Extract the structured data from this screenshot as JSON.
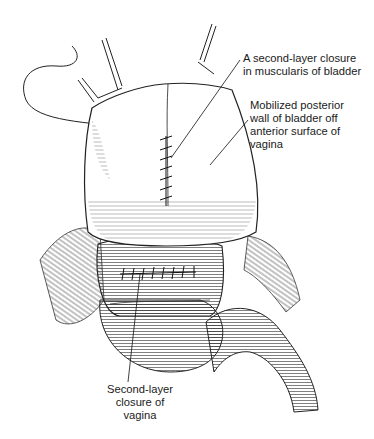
{
  "figure": {
    "labels": [
      {
        "id": "bladder-closure",
        "text": "A second-layer closure\nin muscularis of bladder"
      },
      {
        "id": "mobilized-wall",
        "text": "Mobilized posterior\nwall of bladder off\nanterior surface of\nvagina"
      },
      {
        "id": "vagina-closure",
        "text": "Second-layer\nclosure of\nvagina"
      }
    ],
    "colors": {
      "ink": "#1a1a1a",
      "background": "#ffffff"
    }
  }
}
